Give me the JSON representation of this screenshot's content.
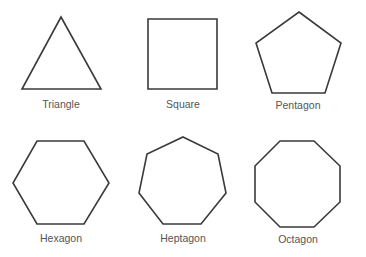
{
  "diagram": {
    "shapes": [
      {
        "name": "Triangle",
        "sides": 3
      },
      {
        "name": "Square",
        "sides": 4
      },
      {
        "name": "Pentagon",
        "sides": 5
      },
      {
        "name": "Hexagon",
        "sides": 6
      },
      {
        "name": "Heptagon",
        "sides": 7
      },
      {
        "name": "Octagon",
        "sides": 8
      }
    ],
    "colors": {
      "stroke": "#3a3a3a",
      "label": "#555555",
      "background": "#ffffff"
    }
  }
}
